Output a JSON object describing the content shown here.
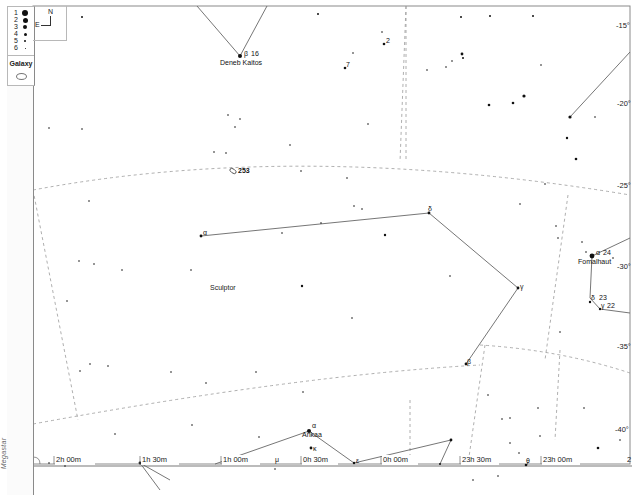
{
  "legend": {
    "magnitudes": [
      "1",
      "2",
      "3",
      "4",
      "5",
      "6"
    ],
    "galaxy_label": "Galaxy",
    "galaxy_icon": "galaxy-ellipse-icon"
  },
  "compass": {
    "north": "N",
    "east": "E"
  },
  "watermark": "Megastar",
  "ra_labels": [
    "2h 00m",
    "1h 30m",
    "1h 00m",
    "0h 30m",
    "0h 00m",
    "23h 30m",
    "23h 00m",
    "2"
  ],
  "dec_labels": [
    "-15°",
    "-20°",
    "-25°",
    "-30°",
    "-35°",
    "-40°"
  ],
  "constellations": [
    "Sculptor",
    "Grus"
  ],
  "star_labels": {
    "deneb_kaitos_greek": "β",
    "deneb_kaitos_flamsteed": "16",
    "deneb_kaitos_name": "Deneb Kaitos",
    "cet7": "7",
    "cet2": "2",
    "scl_alpha": "α",
    "scl_delta": "δ",
    "scl_gamma": "γ",
    "scl_beta": "β",
    "fomalhaut_greek": "α",
    "fomalhaut_flamsteed": "24",
    "fomalhaut_name": "Fomalhaut",
    "psa_delta": "δ",
    "psa_delta_num": "23",
    "psa_gamma": "γ",
    "psa_gamma_num": "22",
    "phe_alpha": "α",
    "phe_alpha_name": "Ankaa",
    "phe_kappa": "κ",
    "phe_epsilon": "ε",
    "phe_mu": "μ",
    "phe_gamma": "γ",
    "gru_theta": "θ"
  },
  "deep_sky": {
    "ngc253_label": "253",
    "ngc253_icon": "galaxy-ellipse-icon"
  }
}
